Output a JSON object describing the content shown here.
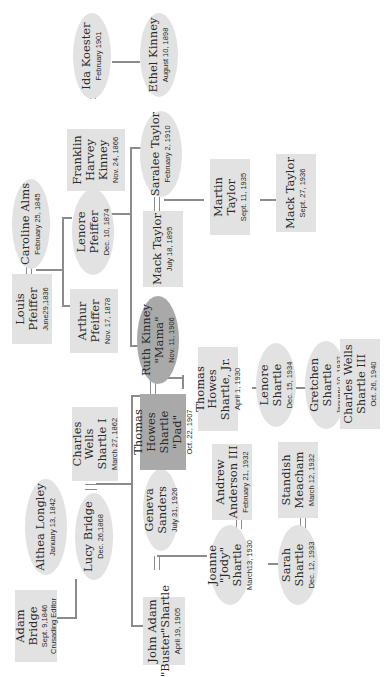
{
  "diagram": {
    "type": "family-tree",
    "orientation": "rotated-90-ccw",
    "colors": {
      "box": "#e2e2e2",
      "highlight": "#a9a9a9",
      "line": "#8c8c8c"
    },
    "people": {
      "adam_bridge": {
        "name": "Adam Bridge",
        "date": "Sept. 9,1846",
        "note": "Crusading Editor"
      },
      "althea_longley": {
        "name": "Althea Longley",
        "date": "January 13, 1842"
      },
      "lucy_bridge": {
        "name": "Lucy Bridge",
        "date": "Dec. 26,1868"
      },
      "charles_wells_shartle_i": {
        "name": "Charles\nWells\nShartle I",
        "date": "March 27, 1862"
      },
      "louis_pfeiffer": {
        "name": "Louis Pfeiffer",
        "date": "June29,1836"
      },
      "caroline_alms": {
        "name": "Caroline Alms",
        "date": "February 25, 1845"
      },
      "arthur_pfeiffer": {
        "name": "Arthur\nPfeiffer",
        "date": "Nov. 17, 1878"
      },
      "lenore_pfeiffer": {
        "name": "Lenore Pfeiffer",
        "date": "Dec. 10, 1874"
      },
      "franklin_harvey_kinney": {
        "name": "Franklin\nHarvey\nKinney",
        "date": "Nov. 24, 1866"
      },
      "ida_koester": {
        "name": "Ida Koester",
        "date": "February 1901"
      },
      "ethel_kinney": {
        "name": "Ethel Kinney",
        "date": "August 10, 1898"
      },
      "saralee_taylor": {
        "name": "Saralee Taylor",
        "date": "February 2, 1910"
      },
      "mack_taylor_1895": {
        "name": "Mack Taylor",
        "date": "July 18, 1895"
      },
      "martin_taylor": {
        "name": "Martin Taylor",
        "date": "Sept. 11, 1935"
      },
      "mack_taylor_1936": {
        "name": "Mack Taylor",
        "date": "Sept. 27, 1936"
      },
      "john_adam_shartle": {
        "name": "John Adam\n\"Buster\"Shartle",
        "date": "April 19, 1905"
      },
      "geneva_sanders": {
        "name": "Geneva Sanders",
        "date": "July 31, 1926"
      },
      "thomas_howes_shartle": {
        "name": "Thomas Howes\nShartle\n\"Dad\"",
        "date": "Oct. 22, 1907"
      },
      "ruth_kinney": {
        "name": "Ruth Kinney\n\"Mama\"",
        "date": "Nov. 11, 1906"
      },
      "joanne_shartle": {
        "name": "Joanne\n\"Jody\" Shartle",
        "date": "March13, 1930"
      },
      "andrew_anderson_iii": {
        "name": "Andrew\nAnderson III",
        "date": "February 21, 1932"
      },
      "sarah_shartle": {
        "name": "Sarah Shartle",
        "date": "Dec. 12, 1933"
      },
      "standish_meacham": {
        "name": "Standish\nMeacham",
        "date": "March 12, 1932"
      },
      "thomas_howes_shartle_jr": {
        "name": "Thomas Howes\nShartle, Jr.",
        "date": "April 1, 1930"
      },
      "lenore_shartle": {
        "name": "Lenore Shartle",
        "date": "Dec. 15, 1934"
      },
      "gretchen_shartle": {
        "name": "Gretchen Shartle",
        "date": "January 10, 1937"
      },
      "charles_wells_shartle_iii": {
        "name": "Charles Wells\nShartle III",
        "date": "Oct. 26, 1940"
      }
    },
    "marriages": [
      [
        "adam_bridge",
        "althea_longley"
      ],
      [
        "lucy_bridge",
        "charles_wells_shartle_i"
      ],
      [
        "louis_pfeiffer",
        "caroline_alms"
      ],
      [
        "lenore_pfeiffer",
        "franklin_harvey_kinney"
      ],
      [
        "franklin_harvey_kinney",
        "ida_koester"
      ],
      [
        "saralee_taylor",
        "mack_taylor_1895"
      ],
      [
        "john_adam_shartle",
        "geneva_sanders"
      ],
      [
        "thomas_howes_shartle",
        "ruth_kinney"
      ],
      [
        "joanne_shartle",
        "andrew_anderson_iii"
      ],
      [
        "sarah_shartle",
        "standish_meacham"
      ]
    ]
  }
}
